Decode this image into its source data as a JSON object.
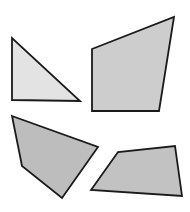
{
  "diagram": {
    "background": "#ffffff",
    "stroke": "#1a1a1a",
    "stroke_width": 1.8,
    "shapes": [
      {
        "name": "right-triangle",
        "type": "triangle",
        "points": [
          [
            12,
            38
          ],
          [
            12,
            100
          ],
          [
            80,
            101
          ]
        ],
        "fill": "#e3e3e3"
      },
      {
        "name": "upper-right-quadrilateral",
        "type": "quadrilateral",
        "points": [
          [
            92,
            49
          ],
          [
            174,
            17
          ],
          [
            159,
            111
          ],
          [
            92,
            111
          ]
        ],
        "fill": "#cdcdcd"
      },
      {
        "name": "lower-left-quadrilateral",
        "type": "quadrilateral",
        "points": [
          [
            12,
            116
          ],
          [
            98,
            147
          ],
          [
            62,
            198
          ],
          [
            22,
            166
          ]
        ],
        "fill": "#bdbdbd"
      },
      {
        "name": "lower-right-quadrilateral",
        "type": "quadrilateral",
        "points": [
          [
            91,
            190
          ],
          [
            118,
            152
          ],
          [
            175,
            146
          ],
          [
            182,
            196
          ]
        ],
        "fill": "#c2c2c2"
      }
    ]
  }
}
